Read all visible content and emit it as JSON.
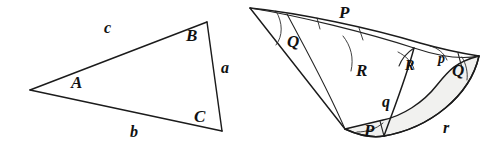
{
  "figure": {
    "background_color": "#ffffff",
    "ink_color": "#1b1b1b",
    "shade_color": "#f0f0ee",
    "width": 496,
    "height": 151
  },
  "plane_triangle": {
    "name": "plane-triangle",
    "vertex_labels": [
      {
        "id": "vertex-a",
        "text": "A",
        "x": 71,
        "y": 74
      },
      {
        "id": "vertex-b",
        "text": "B",
        "x": 186,
        "y": 27
      },
      {
        "id": "vertex-c",
        "text": "C",
        "x": 194,
        "y": 108
      }
    ],
    "side_labels": [
      {
        "id": "side-a",
        "text": "a",
        "x": 221,
        "y": 60
      },
      {
        "id": "side-b",
        "text": "b",
        "x": 130,
        "y": 124
      },
      {
        "id": "side-c",
        "text": "c",
        "x": 104,
        "y": 20
      }
    ],
    "vertices": {
      "A": {
        "x": 30,
        "y": 90
      },
      "B": {
        "x": 207,
        "y": 22
      },
      "C": {
        "x": 222,
        "y": 131
      }
    }
  },
  "spherical_triangle": {
    "name": "spherical-triangle",
    "angle_labels": [
      {
        "id": "angle-p-top",
        "text": "P",
        "x": 339,
        "y": 4
      },
      {
        "id": "angle-q-left",
        "text": "Q",
        "x": 287,
        "y": 33
      },
      {
        "id": "angle-r-mid",
        "text": "R",
        "x": 356,
        "y": 62
      },
      {
        "id": "angle-r-right",
        "text": "R",
        "x": 405,
        "y": 59
      },
      {
        "id": "angle-p-small",
        "text": "p",
        "x": 438,
        "y": 52
      },
      {
        "id": "angle-q-right",
        "text": "Q",
        "x": 452,
        "y": 62
      },
      {
        "id": "angle-q-arc",
        "text": "q",
        "x": 382,
        "y": 94
      },
      {
        "id": "angle-p-bottom",
        "text": "P",
        "x": 364,
        "y": 122
      },
      {
        "id": "angle-r-bottom",
        "text": "r",
        "x": 443,
        "y": 120
      }
    ],
    "apex": {
      "x": 250,
      "y": 8
    },
    "right_vertex": {
      "x": 479,
      "y": 56
    },
    "bottom_vertex": {
      "x": 345,
      "y": 129
    }
  }
}
